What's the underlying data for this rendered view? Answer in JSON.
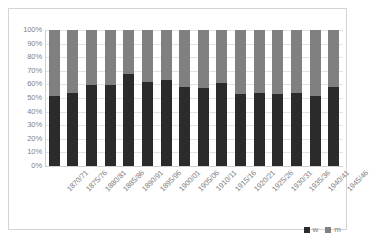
{
  "chart_data": {
    "type": "bar",
    "subtype": "stacked-percentage",
    "title": "",
    "subtitle": "",
    "xlabel": "",
    "ylabel": "",
    "ylim": [
      0,
      100
    ],
    "yunit": "%",
    "grid": true,
    "legend_position": "bottom-right",
    "categories": [
      "1870/71",
      "1875/76",
      "1880/81",
      "1885/86",
      "1890/91",
      "1895/96",
      "1900/01",
      "1905/06",
      "1910/11",
      "1915/16",
      "1920/21",
      "1925/26",
      "1930/31",
      "1935/36",
      "1940/41",
      "1945/46"
    ],
    "series": [
      {
        "name": "w",
        "color": "#2b2b2b",
        "values": [
          51.5,
          54.0,
          59.5,
          59.5,
          67.5,
          61.5,
          63.5,
          58.0,
          57.5,
          61.0,
          53.0,
          53.5,
          53.0,
          53.5,
          51.5,
          58.0
        ]
      },
      {
        "name": "m",
        "color": "#808080",
        "values": [
          48.5,
          46.0,
          40.5,
          40.5,
          32.5,
          38.5,
          36.5,
          42.0,
          42.5,
          39.0,
          47.0,
          46.5,
          47.0,
          46.5,
          48.5,
          42.0
        ]
      }
    ],
    "yticks": [
      "0%",
      "10%",
      "20%",
      "30%",
      "40%",
      "50%",
      "60%",
      "70%",
      "80%",
      "90%",
      "100%"
    ],
    "ytick_values": [
      0,
      10,
      20,
      30,
      40,
      50,
      60,
      70,
      80,
      90,
      100
    ]
  },
  "legend": {
    "entries": [
      {
        "label": "w",
        "color": "#2b2b2b"
      },
      {
        "label": "m",
        "color": "#808080"
      }
    ]
  },
  "colors": {
    "series_w": "#2b2b2b",
    "series_m": "#808080",
    "gridline": "#e3e3e3",
    "axis": "#cfcfcf",
    "tick_text": "#7f7f7f",
    "frame": "#d4d4d4",
    "background": "#ffffff"
  }
}
